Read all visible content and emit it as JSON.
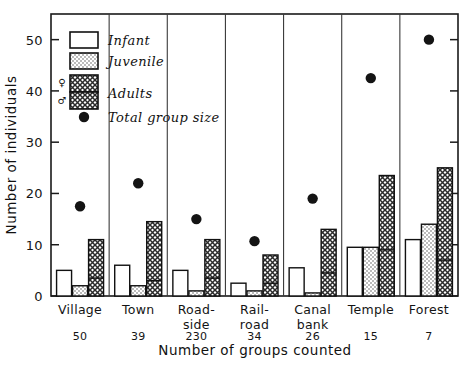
{
  "chart_data": {
    "type": "bar",
    "title": "",
    "xlabel": "Number of groups counted",
    "ylabel": "Number of individuals",
    "ylim": [
      0,
      55
    ],
    "yticks": [
      0,
      10,
      20,
      30,
      40,
      50
    ],
    "ytick_labels": [
      "0",
      "10",
      "20",
      "30",
      "40",
      "50"
    ],
    "grid": false,
    "legend_position": "upper-left",
    "categories": [
      "Village",
      "Town",
      "Road-side",
      "Rail-road",
      "Canal bank",
      "Temple",
      "Forest"
    ],
    "category_lines": [
      [
        "Village",
        ""
      ],
      [
        "Town",
        ""
      ],
      [
        "Road-",
        "side"
      ],
      [
        "Rail-",
        "road"
      ],
      [
        "Canal",
        "bank"
      ],
      [
        "Temple",
        ""
      ],
      [
        "Forest",
        ""
      ]
    ],
    "groups_counted": [
      50,
      39,
      230,
      34,
      26,
      15,
      7
    ],
    "groups_counted_labels": [
      "50",
      "39",
      "230",
      "34",
      "26",
      "15",
      "7"
    ],
    "series": [
      {
        "name": "Infant",
        "fill": "blank",
        "values": [
          5.0,
          6.0,
          5.0,
          2.5,
          5.5,
          9.5,
          11.0
        ]
      },
      {
        "name": "Juvenile",
        "fill": "stipple",
        "values": [
          2.0,
          2.0,
          1.0,
          1.0,
          0.6,
          9.5,
          14.0
        ]
      },
      {
        "name": "Adults",
        "fill": "crosshatch",
        "values": [
          11.0,
          14.5,
          11.0,
          8.0,
          13.0,
          23.5,
          25.0
        ],
        "male_values": [
          3.5,
          3.0,
          3.5,
          2.5,
          4.5,
          9.0,
          7.0
        ],
        "female_values": [
          7.5,
          11.5,
          7.5,
          5.5,
          8.5,
          14.5,
          18.0
        ]
      }
    ],
    "overlay": {
      "name": "Total group size",
      "marker": "filled-circle",
      "values": [
        17.5,
        22.0,
        15.0,
        10.7,
        19.0,
        42.5,
        50.0
      ]
    },
    "legend": {
      "entries": [
        {
          "label": "Infant",
          "swatch": "blank"
        },
        {
          "label": "Juvenile",
          "swatch": "stipple"
        },
        {
          "label": "Adults",
          "swatch": "crosshatch-split"
        },
        {
          "label": "Total  group  size",
          "swatch": "filled-circle"
        }
      ],
      "female_symbol": "♀",
      "male_symbol": "♂"
    },
    "colors": {
      "ink": "#111111",
      "blank_fill": "#ffffff",
      "stipple_fill": "#e8e8e8",
      "crosshatch_fill": "#bdbdbd",
      "marker": "#141414"
    }
  }
}
